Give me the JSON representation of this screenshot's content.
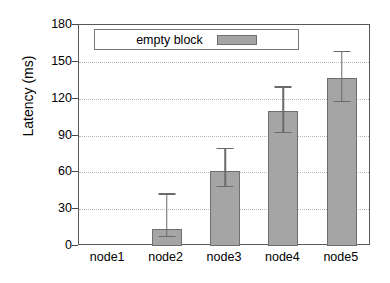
{
  "chart_data": {
    "type": "bar",
    "title": "",
    "xlabel": "",
    "ylabel": "Latency (ms)",
    "categories": [
      "node1",
      "node2",
      "node3",
      "node4",
      "node5"
    ],
    "values": [
      0,
      14,
      61,
      110,
      137
    ],
    "error_low": [
      0,
      7,
      48,
      92,
      117
    ],
    "error_high": [
      0,
      43,
      80,
      130,
      159
    ],
    "ylim": [
      0,
      180
    ],
    "yticks": [
      0,
      30,
      60,
      90,
      120,
      150,
      180
    ],
    "ytick_labels": [
      "0",
      "30",
      "60",
      "90",
      "120",
      "150",
      "180"
    ],
    "grid": "horizontal-dotted",
    "legend": {
      "position": "top-left-inside",
      "entries": [
        {
          "name": "empty block",
          "color": "#a5a5a5"
        }
      ]
    },
    "series": [
      {
        "name": "empty block",
        "values": [
          0,
          14,
          61,
          110,
          137
        ],
        "error_low": [
          0,
          7,
          48,
          92,
          117
        ],
        "error_high": [
          0,
          43,
          80,
          130,
          159
        ]
      }
    ],
    "colors": {
      "bar_fill": "#a5a5a5",
      "bar_border": "#6e6e6e",
      "axis": "#5a5a5a",
      "grid": "#b9b9b9",
      "text": "#000000"
    }
  }
}
